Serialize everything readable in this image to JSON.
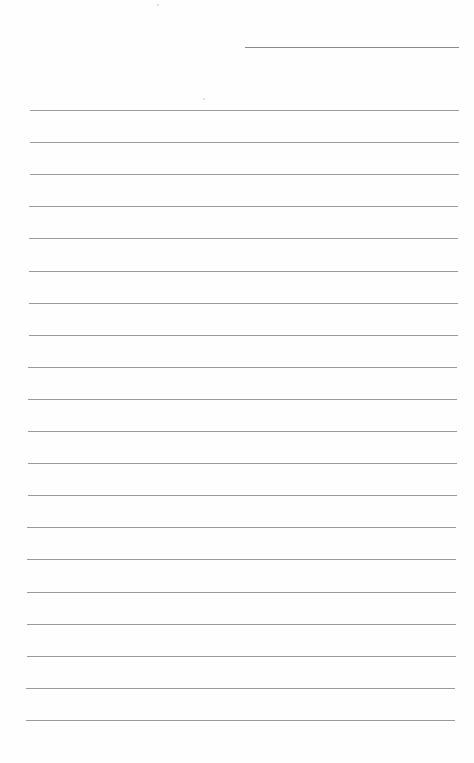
{
  "page": {
    "type": "lined-notebook-page",
    "background": "#fefefe",
    "line_color": "#9a9a9a",
    "header_line": {
      "present": true
    },
    "ruled_line_count": 20,
    "text": ""
  }
}
